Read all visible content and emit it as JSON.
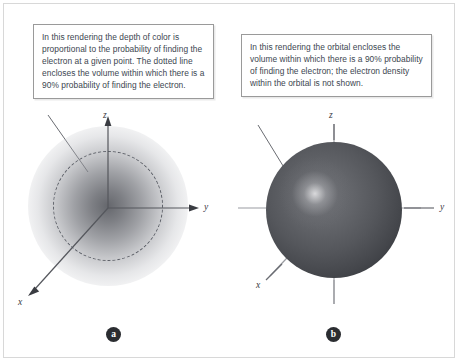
{
  "figure": {
    "panels": [
      {
        "id": "a",
        "badge_label": "a",
        "callout_text": "In this rendering the depth of color is proportional to the probability of finding the electron at a given point. The dotted line encloses the volume within which there is a 90% probability of finding the electron.",
        "rendering_style": "graded electron-density cloud with dashed 90% boundary",
        "axes": [
          {
            "name": "z-axis",
            "label": "z",
            "direction": "up"
          },
          {
            "name": "y-axis",
            "label": "y",
            "direction": "right"
          },
          {
            "name": "x-axis",
            "label": "x",
            "direction": "down-left"
          }
        ]
      },
      {
        "id": "b",
        "badge_label": "b",
        "callout_text": "In this rendering the orbital encloses the volume within which there is a 90% probability of finding the electron; the electron density within the orbital is not shown.",
        "rendering_style": "opaque shaded sphere representing the 90% boundary surface",
        "axes": [
          {
            "name": "z-axis",
            "label": "z",
            "direction": "up"
          },
          {
            "name": "y-axis",
            "label": "y",
            "direction": "right"
          },
          {
            "name": "x-axis",
            "label": "x",
            "direction": "down-left"
          }
        ]
      }
    ],
    "colors": {
      "callout_border": "#9a9a9a",
      "callout_text": "#3c4650",
      "axis_line": "#6a6c72",
      "leader_line": "#6a6c72",
      "cloud_core": "#585a60",
      "sphere_dark": "#2b2d32",
      "sphere_light": "#6e7075",
      "badge_fill": "#2b2d31",
      "frame_border": "#d8d8d8"
    }
  }
}
